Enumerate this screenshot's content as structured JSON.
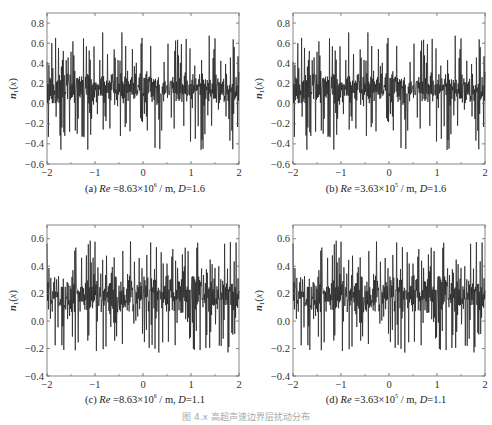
{
  "figure_caption": "图 4.x  高超声速边界层扰动分布",
  "chart_data": [
    {
      "type": "line",
      "panel": "a",
      "caption_prefix": "(a) ",
      "caption_re": "Re",
      "caption_mid": " =8.63×10",
      "caption_exp": "6",
      "caption_tail": " / m, ",
      "caption_d": "D",
      "caption_dval": "=1.6",
      "xlabel": "x / m",
      "ylabel": "n1(x)",
      "xlim": [
        -2,
        2
      ],
      "ylim": [
        -0.6,
        0.9
      ],
      "xticks": [
        -2,
        -1,
        0,
        1,
        2
      ],
      "yticks": [
        -0.6,
        -0.4,
        -0.2,
        0.0,
        0.2,
        0.4,
        0.6,
        0.8
      ],
      "ytick_labels": [
        "−0.6",
        "−0.4",
        "−0.2",
        "0.0",
        "0.2",
        "0.4",
        "0.6",
        "0.8"
      ],
      "xtick_labels": [
        "−2",
        "−1",
        "0",
        "1",
        "2"
      ],
      "signal": {
        "mean": 0.15,
        "band_low": 0.0,
        "band_high": 0.3,
        "max": 0.71,
        "min": -0.46,
        "seed": 11,
        "points": 400
      },
      "grid": false
    },
    {
      "type": "line",
      "panel": "b",
      "caption_prefix": "(b) ",
      "caption_re": "Re",
      "caption_mid": " =3.63×10",
      "caption_exp": "5",
      "caption_tail": " / m, ",
      "caption_d": "D",
      "caption_dval": "=1.6",
      "xlabel": "x / m",
      "ylabel": "n1(x)",
      "xlim": [
        -2,
        2
      ],
      "ylim": [
        -0.6,
        0.9
      ],
      "xticks": [
        -2,
        -1,
        0,
        1,
        2
      ],
      "yticks": [
        -0.6,
        -0.4,
        -0.2,
        0.0,
        0.2,
        0.4,
        0.6,
        0.8
      ],
      "ytick_labels": [
        "−0.6",
        "−0.4",
        "−0.2",
        "0.0",
        "0.2",
        "0.4",
        "0.6",
        "0.8"
      ],
      "xtick_labels": [
        "−2",
        "−1",
        "0",
        "1",
        "2"
      ],
      "signal": {
        "mean": 0.15,
        "band_low": 0.0,
        "band_high": 0.3,
        "max": 0.71,
        "min": -0.46,
        "seed": 11,
        "points": 400
      },
      "grid": false
    },
    {
      "type": "line",
      "panel": "c",
      "caption_prefix": "(c) ",
      "caption_re": "Re",
      "caption_mid": " =8.63×10",
      "caption_exp": "6",
      "caption_tail": " / m, ",
      "caption_d": "D",
      "caption_dval": "=1.1",
      "xlabel": "x / m",
      "ylabel": "n1(x)",
      "xlim": [
        -2,
        2
      ],
      "ylim": [
        -0.4,
        0.7
      ],
      "xticks": [
        -2,
        -1,
        0,
        1,
        2
      ],
      "yticks": [
        -0.4,
        -0.2,
        0.0,
        0.2,
        0.4,
        0.6
      ],
      "ytick_labels": [
        "−0.4",
        "−0.2",
        "0.0",
        "0.2",
        "0.4",
        "0.6"
      ],
      "xtick_labels": [
        "−2",
        "−1",
        "0",
        "1",
        "2"
      ],
      "signal": {
        "mean": 0.18,
        "band_low": 0.06,
        "band_high": 0.32,
        "max": 0.59,
        "min": -0.23,
        "seed": 29,
        "points": 400
      },
      "grid": false
    },
    {
      "type": "line",
      "panel": "d",
      "caption_prefix": "(d) ",
      "caption_re": "Re",
      "caption_mid": " =3.63×10",
      "caption_exp": "5",
      "caption_tail": " / m, ",
      "caption_d": "D",
      "caption_dval": "=1.1",
      "xlabel": "x / m",
      "ylabel": "n1(x)",
      "xlim": [
        -2,
        2
      ],
      "ylim": [
        -0.4,
        0.7
      ],
      "xticks": [
        -2,
        -1,
        0,
        1,
        2
      ],
      "yticks": [
        -0.4,
        -0.2,
        0.0,
        0.2,
        0.4,
        0.6
      ],
      "ytick_labels": [
        "−0.4",
        "−0.2",
        "0.0",
        "0.2",
        "0.4",
        "0.6"
      ],
      "xtick_labels": [
        "−2",
        "−1",
        "0",
        "1",
        "2"
      ],
      "signal": {
        "mean": 0.18,
        "band_low": 0.06,
        "band_high": 0.32,
        "max": 0.59,
        "min": -0.23,
        "seed": 29,
        "points": 400
      },
      "grid": false
    }
  ],
  "colors": {
    "line": "#1a1a1a",
    "axis": "#666666",
    "text": "#333333"
  }
}
